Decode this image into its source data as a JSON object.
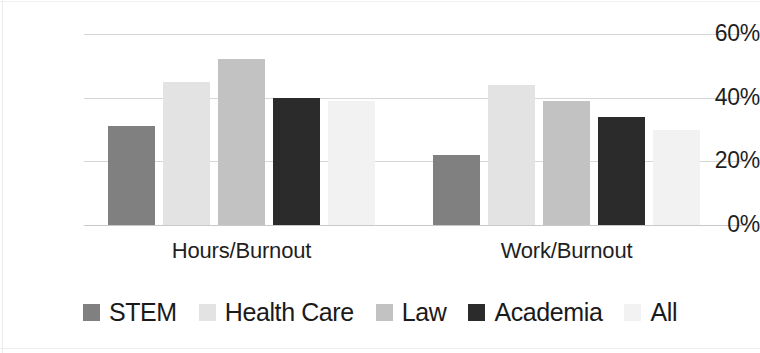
{
  "chart_data": {
    "type": "bar",
    "title": "",
    "subtitle": "",
    "xlabel": "",
    "ylabel": "",
    "categories": [
      "Hours/Burnout",
      "Work/Burnout"
    ],
    "series": [
      {
        "name": "STEM",
        "color": "#808080",
        "values": [
          31,
          22
        ]
      },
      {
        "name": "Health Care",
        "color": "#e3e3e3",
        "values": [
          45,
          44
        ]
      },
      {
        "name": "Law",
        "color": "#c2c2c2",
        "values": [
          52,
          39
        ]
      },
      {
        "name": "Academia",
        "color": "#2b2b2b",
        "values": [
          40,
          34
        ]
      },
      {
        "name": "All",
        "color": "#f2f2f2",
        "values": [
          39,
          30
        ]
      }
    ],
    "ylim": [
      0,
      60
    ],
    "ytick_values": [
      0,
      20,
      40,
      60
    ],
    "ytick_labels": [
      "0%",
      "20%",
      "40%",
      "60%"
    ],
    "value_format": "percent",
    "grid": true,
    "grid_axis": "y",
    "grid_color": "#d6d6d6",
    "legend": true,
    "legend_position": "bottom",
    "background_color": "#ffffff",
    "text_color": "#1a1a1a"
  },
  "axis": {
    "y_ticks": [
      {
        "label": "60%",
        "value": 60
      },
      {
        "label": "40%",
        "value": 40
      },
      {
        "label": "20%",
        "value": 20
      },
      {
        "label": "0%",
        "value": 0
      }
    ],
    "x_categories": [
      {
        "label": "Hours/Burnout"
      },
      {
        "label": "Work/Burnout"
      }
    ]
  },
  "legend": {
    "items": [
      {
        "label": "STEM",
        "color": "#808080"
      },
      {
        "label": "Health Care",
        "color": "#e3e3e3"
      },
      {
        "label": "Law",
        "color": "#c2c2c2"
      },
      {
        "label": "Academia",
        "color": "#2b2b2b"
      },
      {
        "label": "All",
        "color": "#f2f2f2"
      }
    ]
  }
}
